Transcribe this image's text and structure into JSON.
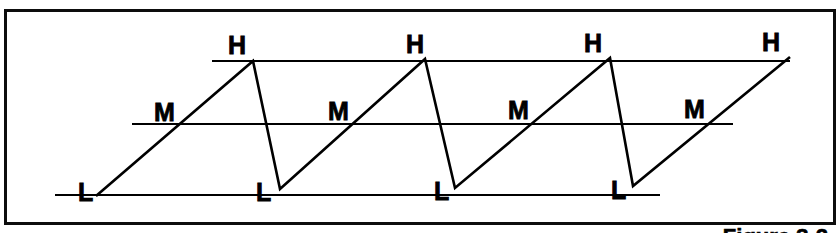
{
  "figure": {
    "caption": "Figure 3-2",
    "frame": {
      "border_color": "#0d0d0d",
      "background": "#ffffff",
      "x": 4,
      "y": 9,
      "width": 832,
      "height": 216
    }
  },
  "chart_data": {
    "type": "line",
    "title": "",
    "xlabel": "",
    "ylabel": "",
    "line_color": "#000000",
    "grid": false,
    "xlim": [
      0,
      840
    ],
    "ylim": [
      233,
      0
    ],
    "levels": [
      {
        "id": "H",
        "label": "H",
        "name": "high",
        "y": 61,
        "x_start": 212,
        "x_end": 790
      },
      {
        "id": "M",
        "label": "M",
        "name": "medium",
        "y": 124,
        "x_start": 132,
        "x_end": 733
      },
      {
        "id": "L",
        "label": "L",
        "name": "low",
        "y": 195,
        "x_start": 55,
        "x_end": 660
      }
    ],
    "waveform_points": [
      {
        "x": 96,
        "y": 196,
        "level": "L"
      },
      {
        "x": 253,
        "y": 61,
        "level": "H"
      },
      {
        "x": 280,
        "y": 189,
        "level": "L"
      },
      {
        "x": 425,
        "y": 59,
        "level": "H"
      },
      {
        "x": 455,
        "y": 188,
        "level": "L"
      },
      {
        "x": 610,
        "y": 58,
        "level": "H"
      },
      {
        "x": 633,
        "y": 186,
        "level": "L"
      },
      {
        "x": 790,
        "y": 57,
        "level": "H"
      }
    ],
    "annotations": [
      {
        "text": "L",
        "x": 78,
        "y": 180,
        "level": "L",
        "index": 0
      },
      {
        "text": "M",
        "x": 154,
        "y": 100,
        "level": "M",
        "index": 0
      },
      {
        "text": "H",
        "x": 228,
        "y": 33,
        "level": "H",
        "index": 0
      },
      {
        "text": "L",
        "x": 256,
        "y": 180,
        "level": "L",
        "index": 1
      },
      {
        "text": "M",
        "x": 328,
        "y": 99,
        "level": "M",
        "index": 1
      },
      {
        "text": "H",
        "x": 406,
        "y": 32,
        "level": "H",
        "index": 1
      },
      {
        "text": "L",
        "x": 434,
        "y": 179,
        "level": "L",
        "index": 2
      },
      {
        "text": "M",
        "x": 508,
        "y": 98,
        "level": "M",
        "index": 2
      },
      {
        "text": "H",
        "x": 584,
        "y": 31,
        "level": "H",
        "index": 2
      },
      {
        "text": "L",
        "x": 611,
        "y": 178,
        "level": "L",
        "index": 3
      },
      {
        "text": "M",
        "x": 684,
        "y": 97,
        "level": "M",
        "index": 3
      },
      {
        "text": "H",
        "x": 762,
        "y": 30,
        "level": "H",
        "index": 3
      }
    ]
  }
}
